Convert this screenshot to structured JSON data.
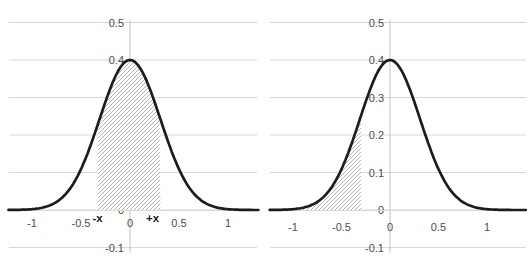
{
  "figure": {
    "title": ""
  },
  "colors": {
    "curve": "#1c1c1c",
    "gridline": "#d8d8d8",
    "axis_line": "#c2c2c2",
    "tick_label": "#4d4d4d",
    "region_label": "#1a1a1a",
    "hatch_line": "#b3b3b3",
    "hatch_background": "#ffffff",
    "background": "#ffffff"
  },
  "chart_data": [
    {
      "name": "left-chart",
      "type": "area",
      "title": "",
      "xlabel": "",
      "ylabel": "",
      "grid": true,
      "curve": {
        "shape": "gaussian",
        "mean": 0,
        "sigma": 0.31,
        "peak": 0.4
      },
      "xlim": [
        -1.24,
        1.31
      ],
      "ylim": [
        -0.1,
        0.5
      ],
      "x_ticks": [
        {
          "v": -1,
          "label": "-1"
        },
        {
          "v": -0.5,
          "label": "-0.5"
        },
        {
          "v": 0,
          "label": "0"
        },
        {
          "v": 0.5,
          "label": "0.5"
        },
        {
          "v": 1,
          "label": "1"
        }
      ],
      "y_ticks": [
        {
          "v": 0.5,
          "label": "0.5"
        },
        {
          "v": 0.4,
          "label": "0.4"
        },
        {
          "v": 0.3,
          "label": "0.3"
        },
        {
          "v": 0.2,
          "label": "0.2"
        },
        {
          "v": 0.1,
          "label": "0.1"
        },
        {
          "v": 0,
          "label": "0"
        },
        {
          "v": -0.1,
          "label": "-0.1"
        }
      ],
      "shaded_region": {
        "from": -0.33,
        "to": 0.31,
        "hatch": "diagonal-up",
        "meaning": "P(-x < X < +x)",
        "edge_labels": [
          {
            "v": -0.33,
            "label": "-x"
          },
          {
            "v": 0.23,
            "label": "+x"
          }
        ]
      }
    },
    {
      "name": "right-chart",
      "type": "area",
      "title": "",
      "xlabel": "",
      "ylabel": "",
      "grid": true,
      "curve": {
        "shape": "gaussian",
        "mean": 0,
        "sigma": 0.31,
        "peak": 0.4
      },
      "xlim": [
        -1.24,
        1.4
      ],
      "ylim": [
        -0.1,
        0.5
      ],
      "x_ticks": [
        {
          "v": -1,
          "label": "-1"
        },
        {
          "v": -0.5,
          "label": "-0.5"
        },
        {
          "v": 0,
          "label": "0"
        },
        {
          "v": 0.5,
          "label": "0.5"
        },
        {
          "v": 1,
          "label": "1"
        }
      ],
      "y_ticks": [
        {
          "v": 0.5,
          "label": "0.5"
        },
        {
          "v": 0.4,
          "label": "0.4"
        },
        {
          "v": 0.3,
          "label": "0.3"
        },
        {
          "v": 0.2,
          "label": "0.2"
        },
        {
          "v": 0.1,
          "label": "0.1"
        },
        {
          "v": 0,
          "label": "0"
        },
        {
          "v": -0.1,
          "label": "-0.1"
        }
      ],
      "shaded_region": {
        "from": -1.05,
        "to": -0.3,
        "hatch": "diagonal-up",
        "meaning": "P(X < -x)",
        "edge_labels": []
      }
    }
  ]
}
